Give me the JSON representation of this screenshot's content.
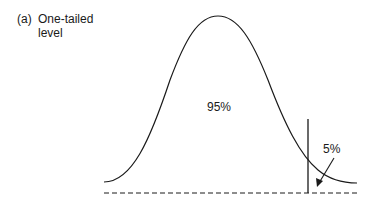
{
  "caption": {
    "letter": "(a)",
    "text": "One-tailed level"
  },
  "regions": {
    "acceptance_label": "95%",
    "rejection_label": "5%"
  },
  "colors": {
    "stroke": "#1a1a1a",
    "background": "#ffffff"
  }
}
